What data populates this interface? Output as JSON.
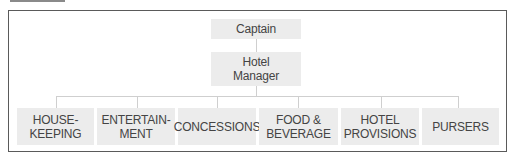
{
  "diagram": {
    "type": "org-chart",
    "root": {
      "label": "Captain"
    },
    "manager": {
      "label": "Hotel\nManager"
    },
    "departments": [
      {
        "label": "HOUSE-\nKEEPING"
      },
      {
        "label": "ENTERTAIN-\nMENT"
      },
      {
        "label": "CONCESSIONS"
      },
      {
        "label": "FOOD &\nBEVERAGE"
      },
      {
        "label": "HOTEL\nPROVISIONS"
      },
      {
        "label": "PURSERS"
      }
    ],
    "colors": {
      "box_fill": "#ececec",
      "text": "#444444",
      "connector": "#cfcfcf",
      "frame_border": "#5a5a5a"
    }
  }
}
